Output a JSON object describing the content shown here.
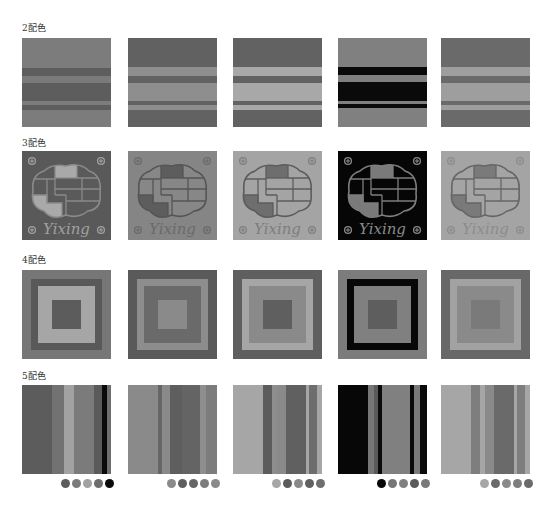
{
  "sections": [
    {
      "label": "2配色"
    },
    {
      "label": "3配色"
    },
    {
      "label": "4配色"
    },
    {
      "label": "5配色"
    }
  ],
  "columns_x": [
    22,
    128,
    233,
    338,
    441
  ],
  "two_color": [
    {
      "bands": [
        [
          "#7c7c7c",
          0,
          30
        ],
        [
          "#5d5d5d",
          30,
          38
        ],
        [
          "#7a7a7a",
          38,
          45
        ],
        [
          "#5d5d5d",
          45,
          63
        ],
        [
          "#7c7c7c",
          63,
          67
        ],
        [
          "#5d5d5d",
          67,
          72
        ],
        [
          "#7c7c7c",
          72,
          89
        ]
      ]
    },
    {
      "bands": [
        [
          "#616161",
          0,
          29
        ],
        [
          "#8e8e8e",
          29,
          38
        ],
        [
          "#626262",
          38,
          45
        ],
        [
          "#8e8e8e",
          45,
          63
        ],
        [
          "#626262",
          63,
          67
        ],
        [
          "#8e8e8e",
          67,
          72
        ],
        [
          "#626262",
          72,
          89
        ]
      ]
    },
    {
      "bands": [
        [
          "#626262",
          0,
          29
        ],
        [
          "#a8a8a8",
          29,
          38
        ],
        [
          "#626262",
          38,
          45
        ],
        [
          "#a8a8a8",
          45,
          63
        ],
        [
          "#626262",
          63,
          67
        ],
        [
          "#a8a8a8",
          67,
          72
        ],
        [
          "#626262",
          72,
          89
        ]
      ]
    },
    {
      "bands": [
        [
          "#808080",
          0,
          29
        ],
        [
          "#0a0a0a",
          29,
          37
        ],
        [
          "#808080",
          37,
          44
        ],
        [
          "#0a0a0a",
          44,
          63
        ],
        [
          "#808080",
          63,
          66
        ],
        [
          "#0a0a0a",
          66,
          70
        ],
        [
          "#808080",
          70,
          89
        ]
      ]
    },
    {
      "bands": [
        [
          "#6a6a6a",
          0,
          29
        ],
        [
          "#9e9e9e",
          29,
          38
        ],
        [
          "#6a6a6a",
          38,
          45
        ],
        [
          "#9e9e9e",
          45,
          63
        ],
        [
          "#6a6a6a",
          63,
          67
        ],
        [
          "#9e9e9e",
          67,
          72
        ],
        [
          "#6a6a6a",
          72,
          89
        ]
      ]
    }
  ],
  "three_color": [
    {
      "bg": "#595959",
      "line": "#8a8a8a",
      "fill_a": "#a9a9a9",
      "fill_b": "#5a5a5a",
      "fill_c": "#a9a9a9",
      "text": "#a0a0a0",
      "word": "Yixing"
    },
    {
      "bg": "#858585",
      "line": "#555555",
      "fill_a": "#5d5d5d",
      "fill_b": "#878787",
      "fill_c": "#5d5d5d",
      "text": "#6a6a6a",
      "word": "Yixing"
    },
    {
      "bg": "#a4a4a4",
      "line": "#5c5c5c",
      "fill_a": "#6e6e6e",
      "fill_b": "#a4a4a4",
      "fill_c": "#6e6e6e",
      "text": "#7e7e7e",
      "word": "Yixing"
    },
    {
      "bg": "#060606",
      "line": "#7e7e7e",
      "fill_a": "#7a7a7a",
      "fill_b": "#060606",
      "fill_c": "#7a7a7a",
      "text": "#8a8a8a",
      "word": "Yixing"
    },
    {
      "bg": "#a4a4a4",
      "line": "#666666",
      "fill_a": "#7a7a7a",
      "fill_b": "#a4a4a4",
      "fill_c": "#7a7a7a",
      "text": "#8c8c8c",
      "word": "Yixing"
    }
  ],
  "four_color": [
    {
      "colors": [
        "#777777",
        "#595959",
        "#a6a6a6",
        "#5c5c5c"
      ],
      "insets": [
        0,
        9,
        16,
        30
      ]
    },
    {
      "colors": [
        "#5a5a5a",
        "#8d8d8d",
        "#6a6a6a",
        "#8a8a8a"
      ],
      "insets": [
        0,
        9,
        16,
        30
      ]
    },
    {
      "colors": [
        "#5f5f5f",
        "#a6a6a6",
        "#8a8a8a",
        "#5f5f5f"
      ],
      "insets": [
        0,
        9,
        16,
        30
      ]
    },
    {
      "colors": [
        "#7c7c7c",
        "#080808",
        "#808080",
        "#5e5e5e"
      ],
      "insets": [
        0,
        9,
        16,
        30
      ]
    },
    {
      "colors": [
        "#686868",
        "#a2a2a2",
        "#8a8a8a",
        "#7a7a7a"
      ],
      "insets": [
        0,
        9,
        16,
        30
      ]
    }
  ],
  "five_color": [
    {
      "stripes": [
        [
          "#5c5c5c",
          0,
          30
        ],
        [
          "#727272",
          30,
          42
        ],
        [
          "#a2a2a2",
          42,
          52
        ],
        [
          "#7b7b7b",
          52,
          72
        ],
        [
          "#5a5a5a",
          72,
          80
        ],
        [
          "#0a0a0a",
          80,
          85
        ],
        [
          "#6e6e6e",
          85,
          89
        ]
      ],
      "dots": [
        "#5c5c5c",
        "#7b7b7b",
        "#a2a2a2",
        "#6e6e6e",
        "#0a0a0a"
      ]
    },
    {
      "stripes": [
        [
          "#8a8a8a",
          0,
          30
        ],
        [
          "#666666",
          30,
          34
        ],
        [
          "#8a8a8a",
          34,
          42
        ],
        [
          "#5e5e5e",
          42,
          54
        ],
        [
          "#646464",
          54,
          72
        ],
        [
          "#8e8e8e",
          72,
          78
        ],
        [
          "#7c7c7c",
          78,
          89
        ]
      ],
      "dots": [
        "#8a8a8a",
        "#5e5e5e",
        "#666666",
        "#7c7c7c",
        "#8a8a8a"
      ]
    },
    {
      "stripes": [
        [
          "#a6a6a6",
          0,
          30
        ],
        [
          "#5c5c5c",
          30,
          39
        ],
        [
          "#8e8e8e",
          39,
          44
        ],
        [
          "#8a8a8a",
          44,
          53
        ],
        [
          "#606060",
          53,
          73
        ],
        [
          "#a6a6a6",
          73,
          76
        ],
        [
          "#6e6e6e",
          76,
          84
        ],
        [
          "#a6a6a6",
          84,
          89
        ]
      ],
      "dots": [
        "#a6a6a6",
        "#5c5c5c",
        "#8a8a8a",
        "#606060",
        "#6e6e6e"
      ]
    },
    {
      "stripes": [
        [
          "#070707",
          0,
          30
        ],
        [
          "#767676",
          30,
          36
        ],
        [
          "#5a5a5a",
          36,
          40
        ],
        [
          "#0a0a0a",
          40,
          44
        ],
        [
          "#808080",
          44,
          72
        ],
        [
          "#0a0a0a",
          72,
          76
        ],
        [
          "#7a7a7a",
          76,
          82
        ],
        [
          "#0a0a0a",
          82,
          89
        ]
      ],
      "dots": [
        "#070707",
        "#767676",
        "#808080",
        "#5a5a5a",
        "#7a7a7a"
      ]
    },
    {
      "stripes": [
        [
          "#a6a6a6",
          0,
          30
        ],
        [
          "#7e7e7e",
          30,
          39
        ],
        [
          "#a6a6a6",
          39,
          44
        ],
        [
          "#8a8a8a",
          44,
          53
        ],
        [
          "#6a6a6a",
          53,
          73
        ],
        [
          "#a6a6a6",
          73,
          76
        ],
        [
          "#7e7e7e",
          76,
          84
        ],
        [
          "#a6a6a6",
          84,
          89
        ]
      ],
      "dots": [
        "#a6a6a6",
        "#6a6a6a",
        "#8a8a8a",
        "#7e7e7e",
        "#6a6a6a"
      ]
    }
  ]
}
